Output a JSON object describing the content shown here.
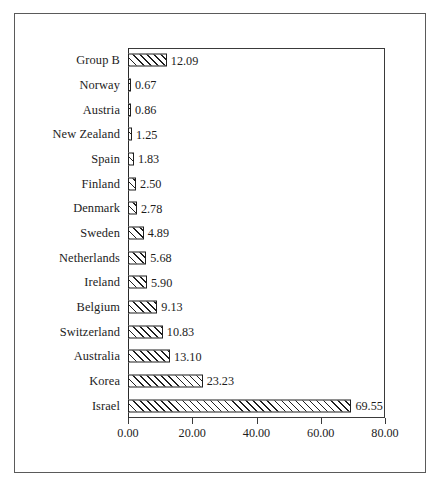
{
  "chart_data": {
    "type": "bar",
    "orientation": "horizontal",
    "title": "",
    "subtitle": "",
    "xlabel": "",
    "ylabel": "",
    "xlim": [
      0,
      80
    ],
    "xticks": [
      "0.00",
      "20.00",
      "40.00",
      "60.00",
      "80.00"
    ],
    "xtick_values": [
      0,
      20,
      40,
      60,
      80
    ],
    "grid": false,
    "legend": false,
    "legend_position": "none",
    "bar_style": {
      "fill": "#ffffff",
      "hatch": "forward-diagonal",
      "edge_color": "#1f1f1f"
    },
    "data_labels": true,
    "categories": [
      "Group B",
      "Norway",
      "Austria",
      "New Zealand",
      "Spain",
      "Finland",
      "Denmark",
      "Sweden",
      "Netherlands",
      "Ireland",
      "Belgium",
      "Switzerland",
      "Australia",
      "Korea",
      "Israel"
    ],
    "values": [
      12.09,
      0.67,
      0.86,
      1.25,
      1.83,
      2.5,
      2.78,
      4.89,
      5.68,
      5.9,
      9.13,
      10.83,
      13.1,
      23.23,
      69.55
    ],
    "value_labels": [
      "12.09",
      "0.67",
      "0.86",
      "1.25",
      "1.83",
      "2.50",
      "2.78",
      "4.89",
      "5.68",
      "5.90",
      "9.13",
      "10.83",
      "13.10",
      "23.23",
      "69.55"
    ],
    "rows": [
      {
        "label": "Group B",
        "value": 12.09,
        "value_label": "12.09"
      },
      {
        "label": "Norway",
        "value": 0.67,
        "value_label": "0.67"
      },
      {
        "label": "Austria",
        "value": 0.86,
        "value_label": "0.86"
      },
      {
        "label": "New Zealand",
        "value": 1.25,
        "value_label": "1.25"
      },
      {
        "label": "Spain",
        "value": 1.83,
        "value_label": "1.83"
      },
      {
        "label": "Finland",
        "value": 2.5,
        "value_label": "2.50"
      },
      {
        "label": "Denmark",
        "value": 2.78,
        "value_label": "2.78"
      },
      {
        "label": "Sweden",
        "value": 4.89,
        "value_label": "4.89"
      },
      {
        "label": "Netherlands",
        "value": 5.68,
        "value_label": "5.68"
      },
      {
        "label": "Ireland",
        "value": 5.9,
        "value_label": "5.90"
      },
      {
        "label": "Belgium",
        "value": 9.13,
        "value_label": "9.13"
      },
      {
        "label": "Switzerland",
        "value": 10.83,
        "value_label": "10.83"
      },
      {
        "label": "Australia",
        "value": 13.1,
        "value_label": "13.10"
      },
      {
        "label": "Korea",
        "value": 23.23,
        "value_label": "23.23"
      },
      {
        "label": "Israel",
        "value": 69.55,
        "value_label": "69.55"
      }
    ]
  },
  "colors": {
    "frame": "#5a5a5a",
    "axis": "#3a3a3a",
    "bar_edge": "#1f1f1f",
    "text": "#1c1c1c",
    "background": "#ffffff"
  }
}
